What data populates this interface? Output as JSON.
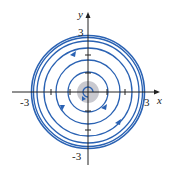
{
  "figure": {
    "type": "phase portrait",
    "axes": {
      "x_label": "x",
      "y_label": "y",
      "x_ticks": [
        "-3",
        "3"
      ],
      "y_ticks": [
        "3",
        "-3"
      ]
    },
    "colors": {
      "trajectory": "#2a62b3",
      "axis": "#222222",
      "center_shade": "#c9c9cf"
    },
    "limit_cycle_radius": 3,
    "arrow_direction": "counterclockwise"
  }
}
